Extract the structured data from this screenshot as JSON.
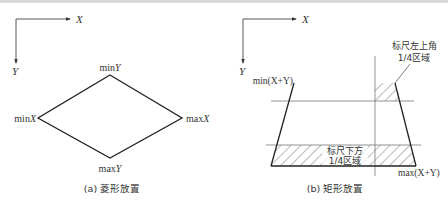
{
  "diagram": {
    "colors": {
      "line": "#222222",
      "thin_line": "#555555",
      "text": "#333333",
      "hatch": "#444444"
    },
    "panel_a": {
      "axes": {
        "x_label": "X",
        "y_label": "Y"
      },
      "shape": "diamond",
      "vertex_labels": {
        "top": "min",
        "top_var": "Y",
        "left": "min",
        "left_var": "X",
        "right": "max",
        "right_var": "X",
        "bottom": "max",
        "bottom_var": "Y"
      },
      "caption": "(a) 菱形放置"
    },
    "panel_b": {
      "axes": {
        "x_label": "X",
        "y_label": "Y"
      },
      "shape": "trapezoid",
      "label_min": "min(X+Y)",
      "label_max": "max(X+Y)",
      "callout_top": {
        "line1": "标尺左上角",
        "line2": "1/4区域"
      },
      "callout_bottom": {
        "line1": "标尺下方",
        "line2": "1/4区域"
      },
      "caption": "(b) 矩形放置"
    }
  }
}
